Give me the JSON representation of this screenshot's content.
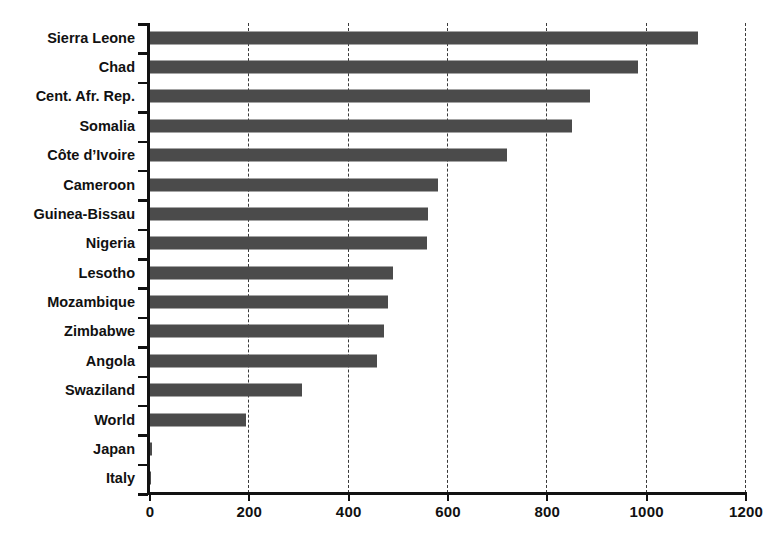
{
  "chart_data": {
    "type": "bar",
    "orientation": "horizontal",
    "title": "",
    "subtitle": "",
    "xlabel": "",
    "ylabel": "",
    "xlim": [
      0,
      1200
    ],
    "xticks": [
      0,
      200,
      400,
      600,
      800,
      1000,
      1200
    ],
    "xtick_labels": [
      "0",
      "200",
      "400",
      "600",
      "800",
      "1000",
      "1200"
    ],
    "grid": "vertical-dashed",
    "legend": "none",
    "bar_color": "#4b4b4b",
    "axis_color": "#111111",
    "gridline_color": "#3a3a3a",
    "categories": [
      "Sierra Leone",
      "Chad",
      "Cent. Afr. Rep.",
      "Somalia",
      "Côte d’Ivoire",
      "Cameroon",
      "Guinea-Bissau",
      "Nigeria",
      "Lesotho",
      "Mozambique",
      "Zimbabwe",
      "Angola",
      "Swaziland",
      "World",
      "Japan",
      "Italy"
    ],
    "values": [
      1105,
      984,
      887,
      852,
      721,
      582,
      562,
      560,
      491,
      481,
      473,
      459,
      309,
      196,
      6,
      4
    ]
  }
}
